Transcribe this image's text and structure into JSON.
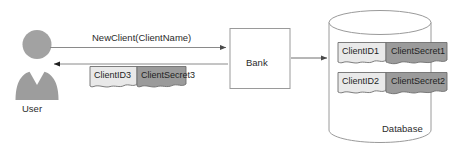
{
  "diagram": {
    "actors": {
      "user": {
        "label": "User",
        "icon": "user-avatar-icon"
      },
      "bank": {
        "label": "Bank"
      },
      "database": {
        "label": "Database",
        "icon": "cylinder-icon"
      }
    },
    "messages": {
      "request": {
        "label": "NewClient(ClientName)",
        "direction": "user-to-bank"
      },
      "response": {
        "direction": "bank-to-user"
      },
      "store": {
        "direction": "bank-to-database"
      }
    },
    "response_documents": [
      {
        "label": "ClientID3",
        "kind": "id"
      },
      {
        "label": "ClientSecret3",
        "kind": "secret"
      }
    ],
    "database_records": [
      [
        {
          "label": "ClientID1",
          "kind": "id"
        },
        {
          "label": "ClientSecret1",
          "kind": "secret"
        }
      ],
      [
        {
          "label": "ClientID2",
          "kind": "id"
        },
        {
          "label": "ClientSecret2",
          "kind": "secret"
        }
      ]
    ],
    "colors": {
      "background": "#ffffff",
      "stroke": "#808080",
      "text": "#2b2b2b",
      "doc_id_fill": "#e9e9e9",
      "doc_secret_fill": "#9b9b9b",
      "doc_border": "#6e6e6e",
      "user_fill": "#a0a0a0",
      "user_shirt": "#ffffff"
    }
  }
}
